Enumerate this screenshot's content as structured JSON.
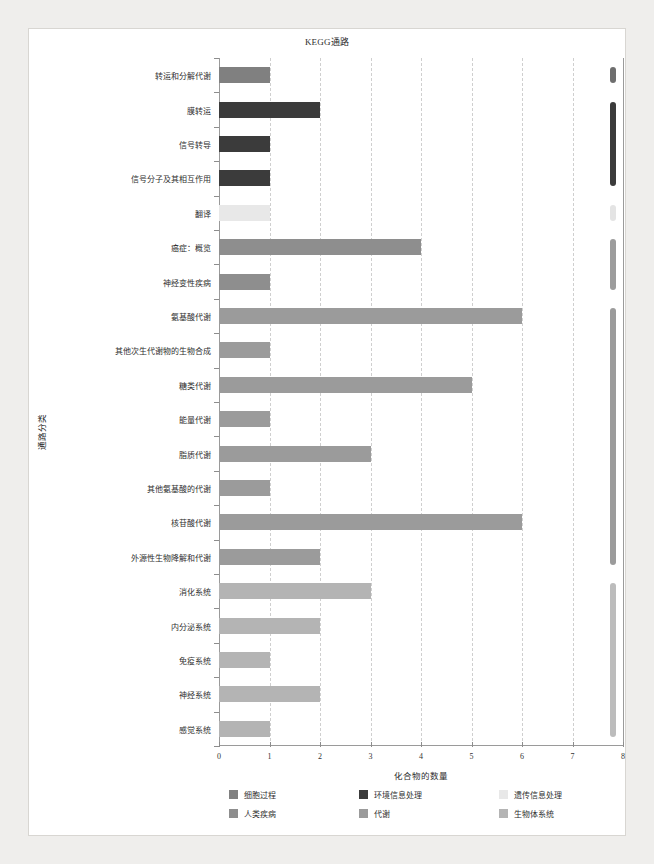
{
  "chart_data": {
    "type": "bar",
    "orientation": "horizontal",
    "title": "KEGG通路",
    "xlabel": "化合物的数量",
    "ylabel": "通路分类",
    "xlim": [
      0,
      8
    ],
    "xticks": [
      "0",
      "1",
      "2",
      "3",
      "4",
      "5",
      "6",
      "7",
      "8"
    ],
    "grid": "vertical-dashed",
    "legend_position": "bottom",
    "categories": [
      "转运和分解代谢",
      "膜转运",
      "信号转导",
      "信号分子及其相互作用",
      "翻译",
      "癌症：概览",
      "神经变性疾病",
      "氨基酸代谢",
      "其他次生代谢物的生物合成",
      "糖类代谢",
      "能量代谢",
      "脂质代谢",
      "其他氨基酸的代谢",
      "核苷酸代谢",
      "外源性生物降解和代谢",
      "消化系统",
      "内分泌系统",
      "免疫系统",
      "神经系统",
      "感觉系统"
    ],
    "values": [
      1,
      2,
      1,
      1,
      1,
      4,
      1,
      6,
      1,
      5,
      1,
      3,
      1,
      6,
      2,
      3,
      2,
      1,
      2,
      1
    ],
    "groups": [
      "细胞过程",
      "环境信息处理",
      "环境信息处理",
      "环境信息处理",
      "遗传信息处理",
      "人类疾病",
      "人类疾病",
      "代谢",
      "代谢",
      "代谢",
      "代谢",
      "代谢",
      "代谢",
      "代谢",
      "代谢",
      "生物体系统",
      "生物体系统",
      "生物体系统",
      "生物体系统",
      "生物体系统"
    ]
  },
  "legend": {
    "items": [
      {
        "label": "细胞过程",
        "color": "#808080"
      },
      {
        "label": "环境信息处理",
        "color": "#3b3b3b"
      },
      {
        "label": "遗传信息处理",
        "color": "#e8e8e8"
      },
      {
        "label": "人类疾病",
        "color": "#8e8e8e"
      },
      {
        "label": "代谢",
        "color": "#9b9b9b"
      },
      {
        "label": "生物体系统",
        "color": "#b4b4b4"
      }
    ]
  },
  "group_colors": {
    "细胞过程": "#808080",
    "环境信息处理": "#3b3b3b",
    "遗传信息处理": "#e8e8e8",
    "人类疾病": "#8e8e8e",
    "代谢": "#9b9b9b",
    "生物体系统": "#b4b4b4"
  },
  "group_markers": [
    {
      "group": "细胞过程",
      "start_index": 0,
      "end_index": 0,
      "color": "#6e6e6e"
    },
    {
      "group": "环境信息处理",
      "start_index": 1,
      "end_index": 3,
      "color": "#3b3b3b"
    },
    {
      "group": "遗传信息处理",
      "start_index": 4,
      "end_index": 4,
      "color": "#e4e4e4"
    },
    {
      "group": "人类疾病",
      "start_index": 5,
      "end_index": 6,
      "color": "#9c9c9c"
    },
    {
      "group": "代谢",
      "start_index": 7,
      "end_index": 14,
      "color": "#9b9b9b"
    },
    {
      "group": "生物体系统",
      "start_index": 15,
      "end_index": 19,
      "color": "#bcbcbc"
    }
  ],
  "marker_x_value": 7.8
}
